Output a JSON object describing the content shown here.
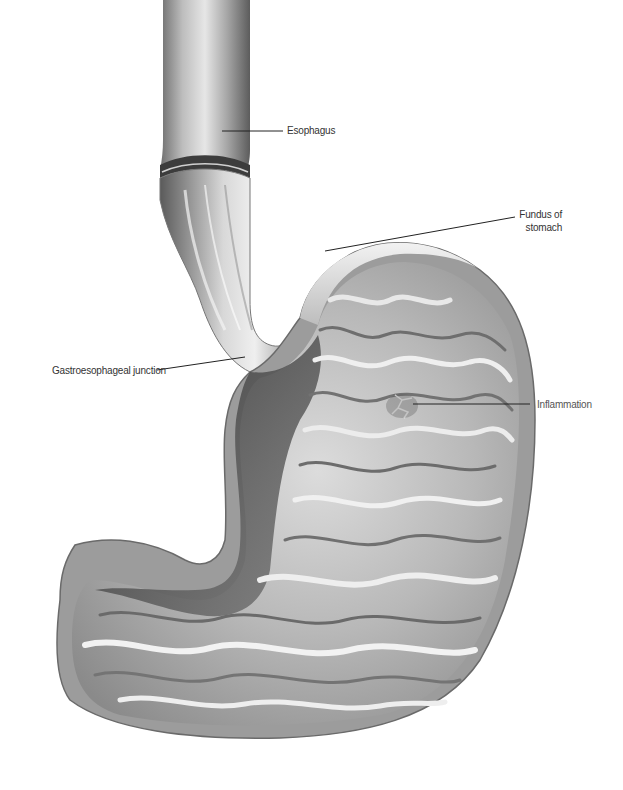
{
  "figure": {
    "colors": {
      "background": "#ffffff",
      "wall_light": "#d9d9d9",
      "wall_mid": "#a8a8a8",
      "wall_dark": "#4a4a4a",
      "lining": "#c8c8c8",
      "label_text": "#333333",
      "leader_line": "#222222"
    }
  },
  "labels": {
    "esophagus": "Esophagus",
    "fundus_line1": "Fundus of",
    "fundus_line2": "stomach",
    "ge_junction": "Gastroesophageal junction",
    "inflammation": "Inflammation"
  }
}
